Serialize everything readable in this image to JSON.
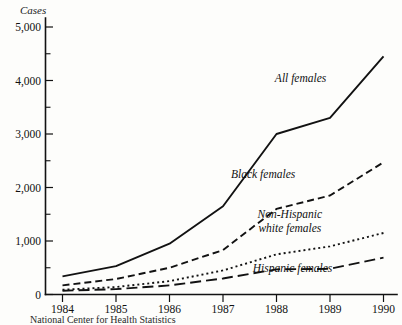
{
  "chart_data": {
    "type": "line",
    "title": "",
    "subtitle": "",
    "xlabel": "",
    "ylabel": "Cases",
    "ylabel_italic": true,
    "x": [
      1984,
      1985,
      1986,
      1987,
      1988,
      1989,
      1990
    ],
    "categories": [
      "1984",
      "1985",
      "1986",
      "1987",
      "1988",
      "1989",
      "1990"
    ],
    "xlim": [
      1983.6,
      1990.2
    ],
    "ylim": [
      0,
      5400
    ],
    "grid": false,
    "legend_position": "inline-annotations",
    "y_major_ticks": [
      0,
      1000,
      2000,
      3000,
      4000,
      5000
    ],
    "y_major_tick_labels": [
      "0",
      "1,000",
      "2,000",
      "3,000",
      "4,000",
      "5,000"
    ],
    "y_minor_ticks": [
      500,
      1500,
      2500,
      3500,
      4500
    ],
    "x_tick_labels": [
      "1984",
      "1985",
      "1986",
      "1987",
      "1988",
      "1989",
      "1990"
    ],
    "series": [
      {
        "name": "All females",
        "style": "solid",
        "label_x": 1988.45,
        "label_y": 3980,
        "values": [
          340,
          530,
          950,
          1650,
          3000,
          3300,
          4450
        ]
      },
      {
        "name": "Black females",
        "style": "dashed",
        "label_x": 1987.75,
        "label_y": 2180,
        "values": [
          170,
          290,
          500,
          830,
          1600,
          1850,
          2470
        ]
      },
      {
        "name": "Non-Hispanic white females",
        "style": "dotted",
        "label_line_1": "Non-Hispanic",
        "label_line_2": "white females",
        "label_x": 1988.25,
        "label_y": 1430,
        "values": [
          90,
          140,
          250,
          450,
          750,
          900,
          1150
        ]
      },
      {
        "name": "Hispanic females",
        "style": "longdash",
        "label_x": 1988.3,
        "label_y": 420,
        "values": [
          70,
          100,
          170,
          300,
          470,
          480,
          690
        ]
      }
    ],
    "caption": "National Center for Health Statistics"
  }
}
